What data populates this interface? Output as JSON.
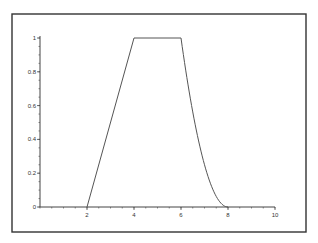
{
  "chart_data": {
    "type": "line",
    "title": "",
    "xlabel": "",
    "ylabel": "",
    "xlim": [
      0,
      10
    ],
    "ylim": [
      0,
      1
    ],
    "grid": false,
    "legend": null,
    "x_ticks": [
      "2",
      "4",
      "6",
      "8",
      "10"
    ],
    "y_ticks": [
      "0",
      "0.2",
      "0.4",
      "0.6",
      "0.8",
      "1"
    ],
    "series": [
      {
        "name": "membership",
        "description": "Trapezoidal membership function: linear rise from 2 to 4, plateau at 1 from 4 to 6, curved (quadratic) fall from 6 to 8",
        "x": [
          0,
          2,
          3,
          4,
          5,
          6,
          6.5,
          7,
          7.5,
          8,
          10
        ],
        "y": [
          0,
          0,
          0.5,
          1,
          1,
          1,
          0.5625,
          0.25,
          0.0625,
          0,
          0
        ]
      }
    ]
  },
  "colors": {
    "line": "#555555",
    "axis": "#444444",
    "frame": "#333333",
    "background": "#ffffff"
  }
}
